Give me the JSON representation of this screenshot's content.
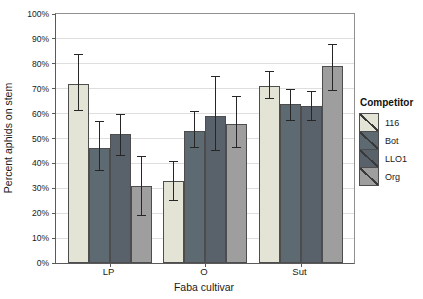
{
  "chart_data": {
    "type": "bar",
    "title": "",
    "xlabel": "Faba cultivar",
    "ylabel": "Percent aphids on stem",
    "legend_title": "Competitor",
    "categories": [
      "LP",
      "O",
      "Sut"
    ],
    "y_ticks": [
      "0%",
      "10%",
      "20%",
      "30%",
      "40%",
      "50%",
      "60%",
      "70%",
      "80%",
      "90%",
      "100%"
    ],
    "ylim": [
      0,
      100
    ],
    "grid": "horizontal",
    "legend_position": "right",
    "error_bars": true,
    "series": [
      {
        "name": "116",
        "color": "#e3e3d6",
        "values": [
          72,
          33,
          71
        ],
        "err_low": [
          61,
          25,
          66
        ],
        "err_high": [
          84,
          41,
          77
        ]
      },
      {
        "name": "Bot",
        "color": "#5e6a72",
        "values": [
          46,
          53,
          64
        ],
        "err_low": [
          37,
          46,
          57
        ],
        "err_high": [
          57,
          61,
          70
        ]
      },
      {
        "name": "LLO1",
        "color": "#59626a",
        "values": [
          52,
          59,
          63
        ],
        "err_low": [
          43,
          45,
          57
        ],
        "err_high": [
          60,
          75,
          69
        ]
      },
      {
        "name": "Org",
        "color": "#9e9e9e",
        "values": [
          31,
          56,
          79
        ],
        "err_low": [
          19,
          46,
          69
        ],
        "err_high": [
          43,
          67,
          88
        ]
      }
    ]
  }
}
